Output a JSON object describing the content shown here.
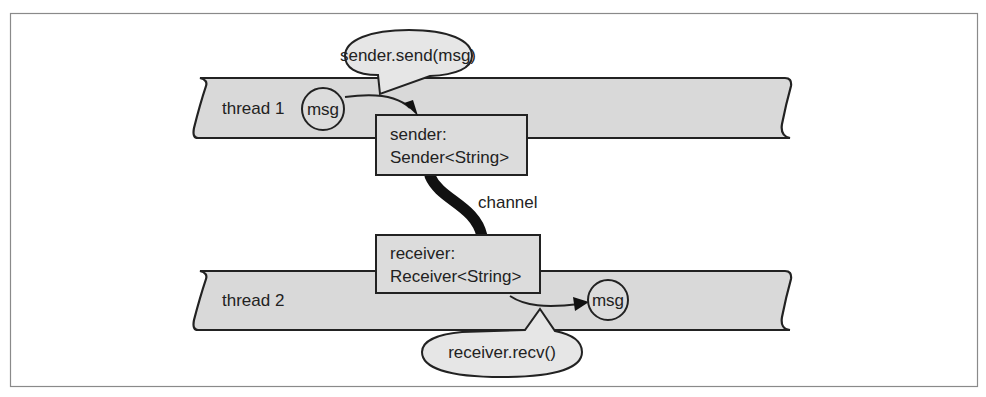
{
  "diagram": {
    "title": "",
    "threads": [
      {
        "label": "thread 1"
      },
      {
        "label": "thread 2"
      }
    ],
    "sender_box": {
      "line1": "sender:",
      "line2": "Sender<String>"
    },
    "receiver_box": {
      "line1": "receiver:",
      "line2": "Receiver<String>"
    },
    "channel_label": "channel",
    "msg_circles": [
      {
        "label": "msg"
      },
      {
        "label": "msg"
      }
    ],
    "callouts": [
      {
        "label": "sender.send(msg)"
      },
      {
        "label": "receiver.recv()"
      }
    ],
    "colors": {
      "band_fill": "#d9d9d9",
      "box_fill": "#dcdcdc",
      "callout_fill": "#e6e6e6",
      "stroke": "#222222",
      "frame": "#888888"
    }
  }
}
